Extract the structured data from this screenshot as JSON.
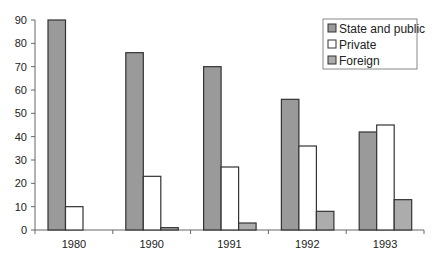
{
  "chart_data": {
    "type": "bar",
    "title": "",
    "xlabel": "",
    "ylabel": "",
    "categories": [
      "1980",
      "1990",
      "1991",
      "1992",
      "1993"
    ],
    "series": [
      {
        "name": "State and public",
        "values": [
          90,
          76,
          70,
          56,
          42
        ],
        "color": "#9a9a9a"
      },
      {
        "name": "Private",
        "values": [
          10,
          23,
          27,
          36,
          45
        ],
        "color": "#ffffff"
      },
      {
        "name": "Foreign",
        "values": [
          0,
          1,
          3,
          8,
          13
        ],
        "color": "#acacac"
      }
    ],
    "ylim": [
      0,
      90
    ],
    "yticks": [
      0,
      10,
      20,
      30,
      40,
      50,
      60,
      70,
      80,
      90
    ],
    "grid": false,
    "legend_position": "upper right"
  },
  "legend": {
    "items": [
      {
        "label": "State and public"
      },
      {
        "label": "Private"
      },
      {
        "label": "Foreign"
      }
    ]
  },
  "colors": {
    "axis": "#666666",
    "bar_border": "#333333"
  }
}
